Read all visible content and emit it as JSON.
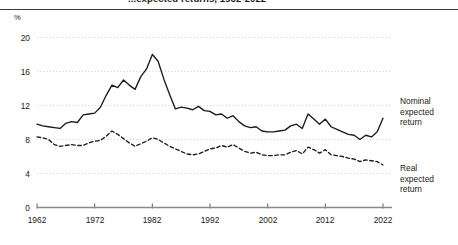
{
  "figure": {
    "title_clipped": "...expected returns, 1962-2022",
    "unit_label": "%"
  },
  "axes": {
    "y_ticks": [
      "0",
      "4",
      "8",
      "12",
      "16",
      "20"
    ],
    "x_ticks": [
      "1962",
      "1972",
      "1982",
      "1992",
      "2002",
      "2012",
      "2022"
    ]
  },
  "legend": {
    "nominal": {
      "line1": "Nominal",
      "line2": "expected",
      "line3": "return"
    },
    "real": {
      "line1": "Real",
      "line2": "expected",
      "line3": "return"
    }
  },
  "colors": {
    "line": "#1a1a1a",
    "grid": "#cccccc",
    "axis": "#808080",
    "background": "#ffffff"
  },
  "chart_data": {
    "type": "line",
    "title": "...expected returns, 1962-2022",
    "xlabel": "",
    "ylabel": "%",
    "xlim": [
      1962,
      2022
    ],
    "ylim": [
      0,
      20
    ],
    "yticks": [
      0,
      4,
      8,
      12,
      16,
      20
    ],
    "xticks": [
      1962,
      1972,
      1982,
      1992,
      2002,
      2012,
      2022
    ],
    "grid": "horizontal-dotted",
    "legend_position": "right-of-plot-inline",
    "x": [
      1962,
      1963,
      1964,
      1965,
      1966,
      1967,
      1968,
      1969,
      1970,
      1971,
      1972,
      1973,
      1974,
      1975,
      1976,
      1977,
      1978,
      1979,
      1980,
      1981,
      1982,
      1983,
      1984,
      1985,
      1986,
      1987,
      1988,
      1989,
      1990,
      1991,
      1992,
      1993,
      1994,
      1995,
      1996,
      1997,
      1998,
      1999,
      2000,
      2001,
      2002,
      2003,
      2004,
      2005,
      2006,
      2007,
      2008,
      2009,
      2010,
      2011,
      2012,
      2013,
      2014,
      2015,
      2016,
      2017,
      2018,
      2019,
      2020,
      2021,
      2022
    ],
    "series": [
      {
        "name": "Nominal expected return",
        "style": "solid",
        "values": [
          9.8,
          9.6,
          9.5,
          9.4,
          9.3,
          9.9,
          10.1,
          10.0,
          10.9,
          11.0,
          11.1,
          11.8,
          13.2,
          14.4,
          14.1,
          15.0,
          14.4,
          13.9,
          15.4,
          16.3,
          18.0,
          17.2,
          15.1,
          13.3,
          11.6,
          11.8,
          11.7,
          11.5,
          11.9,
          11.4,
          11.3,
          10.9,
          11.0,
          10.5,
          10.8,
          10.1,
          9.6,
          9.4,
          9.5,
          9.0,
          8.9,
          8.9,
          9.0,
          9.1,
          9.6,
          9.8,
          9.3,
          11.0,
          10.4,
          9.8,
          10.4,
          9.5,
          9.2,
          8.9,
          8.6,
          8.5,
          8.0,
          8.5,
          8.3,
          8.9,
          10.5
        ]
      },
      {
        "name": "Real expected return",
        "style": "dashed",
        "values": [
          8.3,
          8.2,
          8.0,
          7.4,
          7.2,
          7.3,
          7.4,
          7.3,
          7.3,
          7.6,
          7.8,
          7.9,
          8.4,
          9.0,
          8.6,
          8.1,
          7.6,
          7.2,
          7.5,
          7.8,
          8.2,
          8.0,
          7.6,
          7.2,
          6.9,
          6.6,
          6.3,
          6.2,
          6.3,
          6.6,
          6.9,
          7.0,
          7.3,
          7.1,
          7.4,
          7.0,
          6.6,
          6.4,
          6.5,
          6.2,
          6.1,
          6.1,
          6.2,
          6.2,
          6.5,
          6.7,
          6.3,
          7.1,
          6.8,
          6.4,
          6.8,
          6.2,
          6.1,
          6.0,
          5.8,
          5.7,
          5.4,
          5.6,
          5.5,
          5.4,
          5.0
        ]
      }
    ]
  }
}
